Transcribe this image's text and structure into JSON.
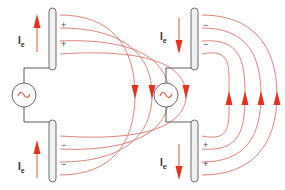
{
  "figure": {
    "background_color": "#ffffff",
    "width": 285,
    "height": 190
  },
  "colors": {
    "rod_fill": "#f2f2f2",
    "rod_stroke": "#6b6b6b",
    "wire": "#5a5a5a",
    "field_line": "#d9776b",
    "field_arrow": "#e8301a",
    "current_arrow": "#e8604d",
    "source_wave": "#e8533f",
    "charge_sign": "#444444",
    "label_text": "#2e2e2e"
  },
  "panels": [
    {
      "id": "left-panel",
      "name": "phase-one",
      "source": {
        "name": "ac-source",
        "symbol": "~",
        "icon": "sine-wave-icon"
      },
      "current": {
        "direction": "up",
        "label_main": "I",
        "label_sub": "e",
        "arrows": [
          {
            "name": "current-arrow-upper",
            "direction": "up"
          },
          {
            "name": "current-arrow-lower",
            "direction": "up"
          }
        ]
      },
      "rods": [
        {
          "name": "upper-rod",
          "position": "top",
          "charge": "+",
          "charge_signs": [
            "+",
            "+"
          ]
        },
        {
          "name": "lower-rod",
          "position": "bottom",
          "charge": "-",
          "charge_signs": [
            "−",
            "−"
          ]
        }
      ],
      "field": {
        "name": "electric-field-lines",
        "line_count": 4,
        "arrow_direction": "down",
        "arrow_count": 4,
        "description": "Field lines arc from positive upper rod to negative lower rod, pointing downward"
      }
    },
    {
      "id": "right-panel",
      "name": "phase-two",
      "source": {
        "name": "ac-source",
        "symbol": "~",
        "icon": "sine-wave-icon"
      },
      "current": {
        "direction": "down",
        "label_main": "I",
        "label_sub": "e",
        "arrows": [
          {
            "name": "current-arrow-upper",
            "direction": "down"
          },
          {
            "name": "current-arrow-lower",
            "direction": "down"
          }
        ]
      },
      "rods": [
        {
          "name": "upper-rod",
          "position": "top",
          "charge": "-",
          "charge_signs": [
            "−",
            "−"
          ]
        },
        {
          "name": "lower-rod",
          "position": "bottom",
          "charge": "+",
          "charge_signs": [
            "+",
            "+"
          ]
        }
      ],
      "field": {
        "name": "electric-field-lines",
        "line_count": 4,
        "arrow_direction": "up",
        "arrow_count": 4,
        "description": "Field lines arc from positive lower rod to negative upper rod, pointing upward"
      }
    }
  ],
  "labels": {
    "left_upper_current": "I",
    "left_upper_current_sub": "e",
    "left_lower_current": "I",
    "left_lower_current_sub": "e",
    "right_upper_current": "I",
    "right_upper_current_sub": "e",
    "right_lower_current": "I",
    "right_lower_current_sub": "e",
    "left_upper_charge_1": "+",
    "left_upper_charge_2": "+",
    "left_lower_charge_1": "−",
    "left_lower_charge_2": "−",
    "right_upper_charge_1": "−",
    "right_upper_charge_2": "−",
    "right_lower_charge_1": "+",
    "right_lower_charge_2": "+",
    "left_source_symbol": "~",
    "right_source_symbol": "~"
  }
}
